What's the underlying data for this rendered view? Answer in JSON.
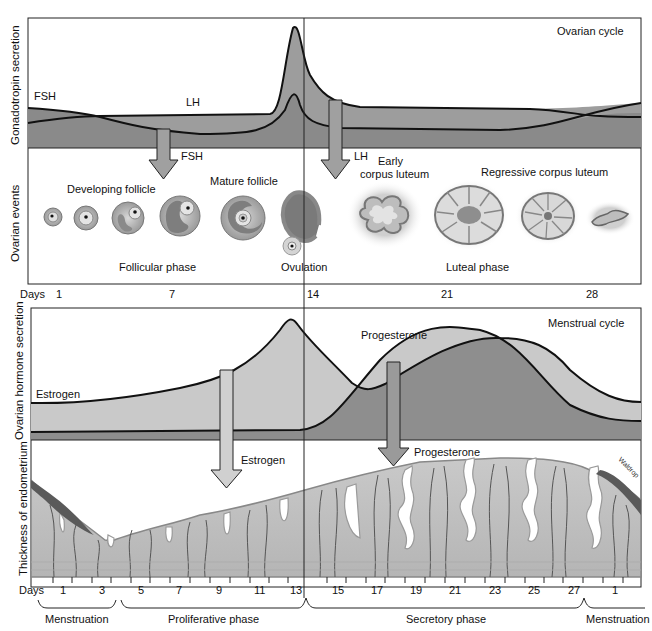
{
  "top_panel": {
    "title": "Ovarian cycle",
    "y_axis_upper": "Gonadotropin secretion",
    "y_axis_lower": "Ovarian events",
    "hormone_labels": {
      "fsh": "FSH",
      "lh": "LH"
    },
    "arrow_labels": {
      "fsh": "FSH",
      "lh": "LH"
    },
    "stage_labels": {
      "developing_follicle": "Developing follicle",
      "mature_follicle": "Mature follicle",
      "early_corpus_luteum_line1": "Early",
      "early_corpus_luteum_line2": "corpus luteum",
      "regressive_corpus_luteum": "Regressive corpus luteum"
    },
    "phase_labels": {
      "follicular": "Follicular phase",
      "ovulation": "Ovulation",
      "luteal": "Luteal phase"
    },
    "days_label": "Days",
    "days": [
      "1",
      "7",
      "14",
      "21",
      "28"
    ]
  },
  "bottom_panel": {
    "title": "Menstrual cycle",
    "y_axis_upper": "Ovarian hormone secretion",
    "y_axis_lower": "Thickness of endometrium",
    "hormone_labels": {
      "estrogen": "Estrogen",
      "progesterone": "Progesterone"
    },
    "arrow_labels": {
      "estrogen": "Estrogen",
      "progesterone": "Progesterone"
    },
    "artist_signature": "Waldrop",
    "days_label": "Days",
    "days": [
      "1",
      "3",
      "5",
      "7",
      "9",
      "11",
      "13",
      "15",
      "17",
      "19",
      "21",
      "23",
      "25",
      "27",
      "1"
    ],
    "phases": [
      "Menstruation",
      "Proliferative phase",
      "Secretory phase",
      "Menstruation"
    ]
  },
  "colors": {
    "dark_fill": "#8e8e8e",
    "mid_fill": "#a9a9a9",
    "light_fill": "#cdcdcd",
    "endometrium": "#c4c4c4",
    "vessel": "#555555",
    "line": "#111111"
  }
}
